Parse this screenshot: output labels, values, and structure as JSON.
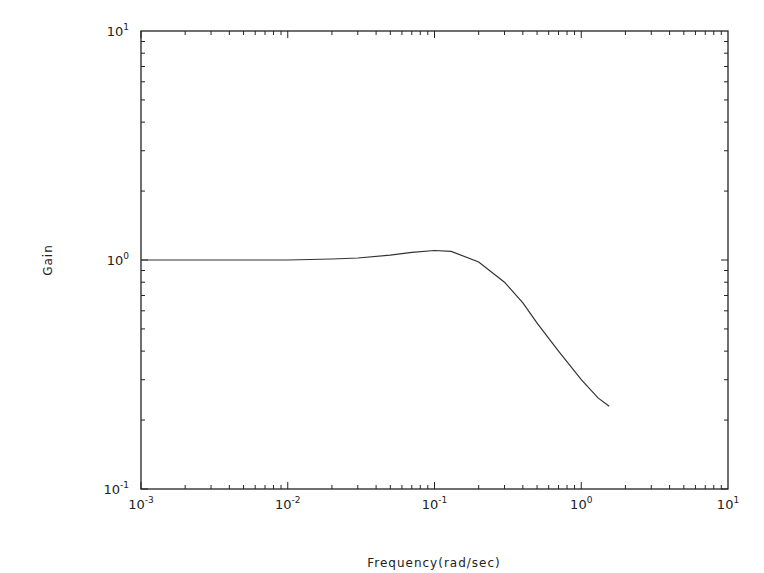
{
  "chart_data": {
    "type": "line",
    "title": "",
    "xlabel": "Frequency(rad/sec)",
    "ylabel": "Gain",
    "xscale": "log",
    "yscale": "log",
    "xlim": [
      0.001,
      10
    ],
    "ylim": [
      0.1,
      10
    ],
    "grid": false,
    "legend": null,
    "x_ticks": [
      {
        "base": "10",
        "exp": "-3",
        "value": 0.001
      },
      {
        "base": "10",
        "exp": "-2",
        "value": 0.01
      },
      {
        "base": "10",
        "exp": "-1",
        "value": 0.1
      },
      {
        "base": "10",
        "exp": "0",
        "value": 1
      },
      {
        "base": "10",
        "exp": "1",
        "value": 10
      }
    ],
    "y_ticks": [
      {
        "base": "10",
        "exp": "-1",
        "value": 0.1
      },
      {
        "base": "10",
        "exp": "0",
        "value": 1
      },
      {
        "base": "10",
        "exp": "1",
        "value": 10
      }
    ],
    "series": [
      {
        "name": "Gain",
        "x": [
          0.001,
          0.003,
          0.01,
          0.02,
          0.03,
          0.05,
          0.07,
          0.1,
          0.13,
          0.2,
          0.3,
          0.4,
          0.5,
          0.7,
          1.0,
          1.3,
          1.55
        ],
        "y": [
          1.0,
          1.0,
          1.0,
          1.01,
          1.02,
          1.05,
          1.08,
          1.1,
          1.09,
          0.98,
          0.8,
          0.65,
          0.53,
          0.4,
          0.3,
          0.25,
          0.23
        ]
      }
    ]
  }
}
